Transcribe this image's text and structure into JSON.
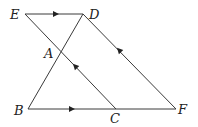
{
  "figure": {
    "type": "geometry-diagram",
    "line_color": "#3a3a3a",
    "points": {
      "E": {
        "label": "E",
        "x": 25,
        "y": 14
      },
      "D": {
        "label": "D",
        "x": 83,
        "y": 14
      },
      "A": {
        "label": "A",
        "x": 59,
        "y": 52
      },
      "B": {
        "label": "B",
        "x": 28,
        "y": 109
      },
      "C": {
        "label": "C",
        "x": 116,
        "y": 109
      },
      "F": {
        "label": "F",
        "x": 176,
        "y": 109
      }
    },
    "segments": [
      {
        "from": "E",
        "to": "D",
        "arrow": "toward D"
      },
      {
        "from": "B",
        "to": "F",
        "arrow": "toward F"
      },
      {
        "from": "C",
        "to": "E",
        "arrow": "toward E",
        "through": "A"
      },
      {
        "from": "F",
        "to": "D",
        "arrow": "toward D"
      },
      {
        "from": "B",
        "to": "D",
        "through": "A"
      }
    ],
    "parallel_pairs": [
      [
        "ED",
        "BF"
      ],
      [
        "EC",
        "DF"
      ]
    ]
  }
}
